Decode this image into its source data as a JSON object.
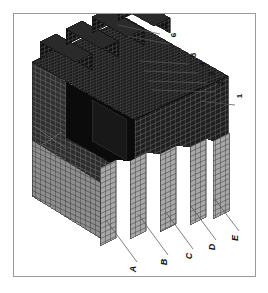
{
  "figure": {
    "kind": "technical-line-drawing",
    "orientation": "labels rotated 90 degrees counter-clockwise",
    "frame": {
      "border_color": "#9a9a9a",
      "background_color": "#ffffff"
    },
    "palette": {
      "mesh_dark": "#141414",
      "mesh_mid": "#3a3a3a",
      "mesh_light": "#8c8c8c",
      "mesh_pale": "#b8b8b8",
      "leader_line": "#555555",
      "label_text": "#111111"
    },
    "numeric_callouts": [
      {
        "id": "callout-7",
        "label": "7",
        "label_x": 166,
        "label_y": 25,
        "line_from_x": 160,
        "line_from_y": 34,
        "line_to_x": 118,
        "line_to_y": 25
      },
      {
        "id": "callout-6",
        "label": "6",
        "label_x": 175,
        "label_y": 35,
        "line_from_x": 169,
        "line_from_y": 44,
        "line_to_x": 128,
        "line_to_y": 36
      },
      {
        "id": "callout-5",
        "label": "5",
        "label_x": 195,
        "label_y": 55,
        "line_from_x": 189,
        "line_from_y": 64,
        "line_to_x": 140,
        "line_to_y": 61
      },
      {
        "id": "callout-4",
        "label": "4",
        "label_x": 204,
        "label_y": 64,
        "line_from_x": 198,
        "line_from_y": 73,
        "line_to_x": 144,
        "line_to_y": 71
      },
      {
        "id": "callout-3",
        "label": "3",
        "label_x": 213,
        "label_y": 74,
        "line_from_x": 207,
        "line_from_y": 83,
        "line_to_x": 148,
        "line_to_y": 81
      },
      {
        "id": "callout-2",
        "label": "2",
        "label_x": 222,
        "label_y": 83,
        "line_from_x": 216,
        "line_from_y": 92,
        "line_to_x": 152,
        "line_to_y": 90
      },
      {
        "id": "callout-1",
        "label": "1",
        "label_x": 241,
        "label_y": 96,
        "line_from_x": 235,
        "line_from_y": 105,
        "line_to_x": 200,
        "line_to_y": 101
      }
    ],
    "letter_callouts": [
      {
        "id": "callout-A",
        "label": "A",
        "label_x": 133,
        "label_y": 270,
        "line_from_x": 137,
        "line_from_y": 262,
        "line_to_x": 106,
        "line_to_y": 220
      },
      {
        "id": "callout-B",
        "label": "B",
        "label_x": 164,
        "label_y": 263,
        "line_from_x": 168,
        "line_from_y": 255,
        "line_to_x": 138,
        "line_to_y": 214
      },
      {
        "id": "callout-C",
        "label": "C",
        "label_x": 189,
        "label_y": 257,
        "line_from_x": 193,
        "line_from_y": 249,
        "line_to_x": 165,
        "line_to_y": 211
      },
      {
        "id": "callout-D",
        "label": "D",
        "label_x": 212,
        "label_y": 248,
        "line_from_x": 216,
        "line_from_y": 240,
        "line_to_x": 190,
        "line_to_y": 205
      },
      {
        "id": "callout-E",
        "label": "E",
        "label_x": 235,
        "label_y": 239,
        "line_from_x": 239,
        "line_from_y": 231,
        "line_to_x": 214,
        "line_to_y": 198
      }
    ]
  }
}
